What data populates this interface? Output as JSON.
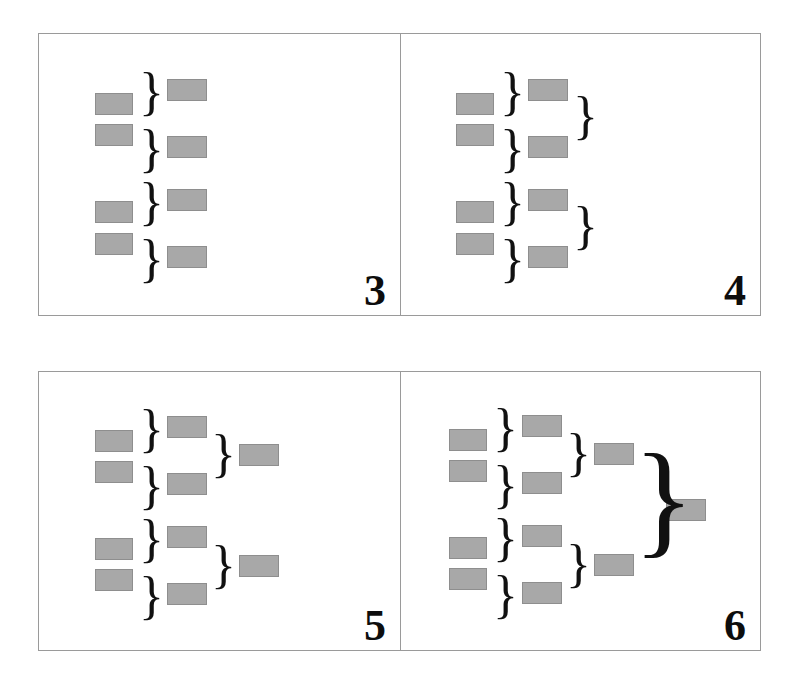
{
  "figure": {
    "title": "",
    "background_color": "#ffffff",
    "panel_border_color": "#9a9a9a",
    "box_fill_color": "#a8a8a8",
    "box_border_color": "#8e8e8e",
    "brace_color": "#111111",
    "number_color": "#0d0d0d",
    "panel_count": 4,
    "grid": "2x2"
  },
  "chart_data": {
    "type": "diagram",
    "title": "",
    "panels": [
      {
        "number": "3",
        "levels": 2,
        "leaf_boxes": 4,
        "column_counts": [
          4,
          4
        ],
        "brace_count": 4,
        "note": "Four leaf boxes, each paired by a brace into four second-level boxes."
      },
      {
        "number": "4",
        "levels": 3,
        "leaf_boxes": 4,
        "column_counts": [
          4,
          4,
          2
        ],
        "brace_count": 6,
        "note": "Adds a second tier of braces grouping pairs of level-2 boxes."
      },
      {
        "number": "5",
        "levels": 3,
        "leaf_boxes": 4,
        "column_counts": [
          4,
          4,
          2
        ],
        "brace_count": 6,
        "note": "Second-tier braces now terminate in two third-level boxes."
      },
      {
        "number": "6",
        "levels": 4,
        "leaf_boxes": 4,
        "column_counts": [
          4,
          4,
          2,
          1
        ],
        "brace_count": 7,
        "note": "A single large brace merges the two third-level boxes into one final box."
      }
    ]
  },
  "panels": {
    "p3": {
      "number": "3",
      "boxes": [
        {
          "name": "leaf-box-1",
          "x": 56,
          "y": 59,
          "w": 38,
          "h": 22
        },
        {
          "name": "leaf-box-2",
          "x": 56,
          "y": 90,
          "w": 38,
          "h": 22
        },
        {
          "name": "leaf-box-3",
          "x": 56,
          "y": 167,
          "w": 38,
          "h": 22
        },
        {
          "name": "leaf-box-4",
          "x": 56,
          "y": 199,
          "w": 38,
          "h": 22
        },
        {
          "name": "level2-box-1",
          "x": 128,
          "y": 45,
          "w": 40,
          "h": 22
        },
        {
          "name": "level2-box-2",
          "x": 128,
          "y": 102,
          "w": 40,
          "h": 22
        },
        {
          "name": "level2-box-3",
          "x": 128,
          "y": 155,
          "w": 40,
          "h": 22
        },
        {
          "name": "level2-box-4",
          "x": 128,
          "y": 212,
          "w": 40,
          "h": 22
        }
      ],
      "braces": [
        {
          "name": "brace-1",
          "x": 100,
          "y": 32,
          "size": 52
        },
        {
          "name": "brace-2",
          "x": 100,
          "y": 89,
          "size": 52
        },
        {
          "name": "brace-3",
          "x": 100,
          "y": 142,
          "size": 52
        },
        {
          "name": "brace-4",
          "x": 100,
          "y": 199,
          "size": 52
        }
      ]
    },
    "p4": {
      "number": "4",
      "boxes": [
        {
          "name": "leaf-box-1",
          "x": 55,
          "y": 59,
          "w": 38,
          "h": 22
        },
        {
          "name": "leaf-box-2",
          "x": 55,
          "y": 90,
          "w": 38,
          "h": 22
        },
        {
          "name": "leaf-box-3",
          "x": 55,
          "y": 167,
          "w": 38,
          "h": 22
        },
        {
          "name": "leaf-box-4",
          "x": 55,
          "y": 199,
          "w": 38,
          "h": 22
        },
        {
          "name": "level2-box-1",
          "x": 127,
          "y": 45,
          "w": 40,
          "h": 22
        },
        {
          "name": "level2-box-2",
          "x": 127,
          "y": 102,
          "w": 40,
          "h": 22
        },
        {
          "name": "level2-box-3",
          "x": 127,
          "y": 155,
          "w": 40,
          "h": 22
        },
        {
          "name": "level2-box-4",
          "x": 127,
          "y": 212,
          "w": 40,
          "h": 22
        }
      ],
      "braces": [
        {
          "name": "brace-1",
          "x": 99,
          "y": 32,
          "size": 52
        },
        {
          "name": "brace-2",
          "x": 99,
          "y": 89,
          "size": 52
        },
        {
          "name": "brace-3",
          "x": 99,
          "y": 142,
          "size": 52
        },
        {
          "name": "brace-4",
          "x": 99,
          "y": 199,
          "size": 52
        },
        {
          "name": "brace-level2-1",
          "x": 172,
          "y": 56,
          "size": 52
        },
        {
          "name": "brace-level2-2",
          "x": 172,
          "y": 166,
          "size": 52
        }
      ]
    },
    "p5": {
      "number": "5",
      "boxes": [
        {
          "name": "leaf-box-1",
          "x": 56,
          "y": 58,
          "w": 38,
          "h": 22
        },
        {
          "name": "leaf-box-2",
          "x": 56,
          "y": 89,
          "w": 38,
          "h": 22
        },
        {
          "name": "leaf-box-3",
          "x": 56,
          "y": 166,
          "w": 38,
          "h": 22
        },
        {
          "name": "leaf-box-4",
          "x": 56,
          "y": 197,
          "w": 38,
          "h": 22
        },
        {
          "name": "level2-box-1",
          "x": 128,
          "y": 44,
          "w": 40,
          "h": 22
        },
        {
          "name": "level2-box-2",
          "x": 128,
          "y": 101,
          "w": 40,
          "h": 22
        },
        {
          "name": "level2-box-3",
          "x": 128,
          "y": 154,
          "w": 40,
          "h": 22
        },
        {
          "name": "level2-box-4",
          "x": 128,
          "y": 211,
          "w": 40,
          "h": 22
        },
        {
          "name": "level3-box-1",
          "x": 200,
          "y": 72,
          "w": 40,
          "h": 22
        },
        {
          "name": "level3-box-2",
          "x": 200,
          "y": 183,
          "w": 40,
          "h": 22
        }
      ],
      "braces": [
        {
          "name": "brace-1",
          "x": 100,
          "y": 31,
          "size": 52
        },
        {
          "name": "brace-2",
          "x": 100,
          "y": 88,
          "size": 52
        },
        {
          "name": "brace-3",
          "x": 100,
          "y": 141,
          "size": 52
        },
        {
          "name": "brace-4",
          "x": 100,
          "y": 198,
          "size": 52
        },
        {
          "name": "brace-level2-1",
          "x": 172,
          "y": 56,
          "size": 52
        },
        {
          "name": "brace-level2-2",
          "x": 172,
          "y": 167,
          "size": 52
        }
      ]
    },
    "p6": {
      "number": "6",
      "boxes": [
        {
          "name": "leaf-box-1",
          "x": 48,
          "y": 57,
          "w": 38,
          "h": 22
        },
        {
          "name": "leaf-box-2",
          "x": 48,
          "y": 88,
          "w": 38,
          "h": 22
        },
        {
          "name": "leaf-box-3",
          "x": 48,
          "y": 165,
          "w": 38,
          "h": 22
        },
        {
          "name": "leaf-box-4",
          "x": 48,
          "y": 196,
          "w": 38,
          "h": 22
        },
        {
          "name": "level2-box-1",
          "x": 121,
          "y": 43,
          "w": 40,
          "h": 22
        },
        {
          "name": "level2-box-2",
          "x": 121,
          "y": 100,
          "w": 40,
          "h": 22
        },
        {
          "name": "level2-box-3",
          "x": 121,
          "y": 153,
          "w": 40,
          "h": 22
        },
        {
          "name": "level2-box-4",
          "x": 121,
          "y": 210,
          "w": 40,
          "h": 22
        },
        {
          "name": "level3-box-1",
          "x": 193,
          "y": 71,
          "w": 40,
          "h": 22
        },
        {
          "name": "level3-box-2",
          "x": 193,
          "y": 182,
          "w": 40,
          "h": 22
        },
        {
          "name": "level4-box-1",
          "x": 265,
          "y": 127,
          "w": 40,
          "h": 22
        }
      ],
      "braces": [
        {
          "name": "brace-1",
          "x": 92,
          "y": 30,
          "size": 52
        },
        {
          "name": "brace-2",
          "x": 92,
          "y": 87,
          "size": 52
        },
        {
          "name": "brace-3",
          "x": 92,
          "y": 140,
          "size": 52
        },
        {
          "name": "brace-4",
          "x": 92,
          "y": 197,
          "size": 52
        },
        {
          "name": "brace-level2-1",
          "x": 165,
          "y": 55,
          "size": 52
        },
        {
          "name": "brace-level2-2",
          "x": 165,
          "y": 166,
          "size": 52
        },
        {
          "name": "brace-level3-1",
          "x": 232,
          "y": 62,
          "size": 128
        }
      ]
    }
  }
}
